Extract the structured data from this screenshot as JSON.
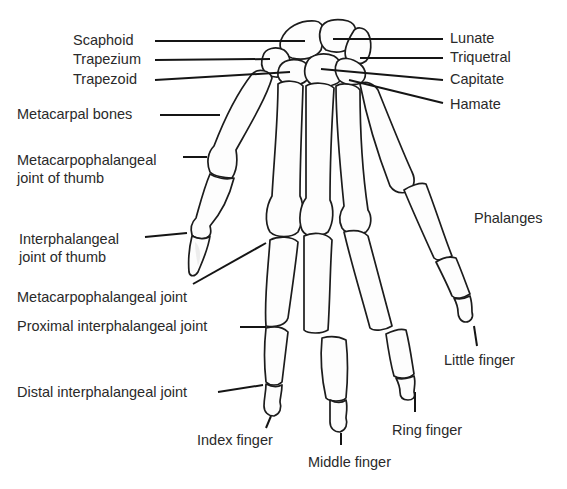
{
  "diagram": {
    "labels": {
      "scaphoid": "Scaphoid",
      "trapezium": "Trapezium",
      "trapezoid": "Trapezoid",
      "metacarpal_bones": "Metacarpal bones",
      "mcp_thumb_line1": "Metacarpophalangeal",
      "mcp_thumb_line2": "joint of thumb",
      "ip_thumb_line1": "Interphalangeal",
      "ip_thumb_line2": "joint of thumb",
      "mcp_joint": "Metacarpophalangeal joint",
      "pip_joint": "Proximal interphalangeal joint",
      "dip_joint": "Distal interphalangeal joint",
      "index_finger": "Index finger",
      "middle_finger": "Middle finger",
      "ring_finger": "Ring finger",
      "little_finger": "Little finger",
      "phalanges": "Phalanges",
      "lunate": "Lunate",
      "triquetral": "Triquetral",
      "capitate": "Capitate",
      "hamate": "Hamate"
    },
    "colors": {
      "bone_fill": "#fdfdfd",
      "outline": "#1c1c1c",
      "text": "#2a2a2a",
      "background": "#ffffff"
    }
  }
}
